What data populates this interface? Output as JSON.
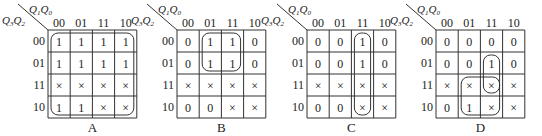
{
  "col_var": {
    "a": "Q",
    "a_sub": "1",
    "b": "Q",
    "b_sub": "0"
  },
  "row_var": {
    "a": "Q",
    "a_sub": "3",
    "b": "Q",
    "b_sub": "2"
  },
  "col_labels": [
    "00",
    "01",
    "11",
    "10"
  ],
  "row_labels": [
    "00",
    "01",
    "11",
    "10"
  ],
  "dont_care_symbol": "×",
  "maps": [
    {
      "caption": "A",
      "cells": [
        [
          "1",
          "1",
          "1",
          "1"
        ],
        [
          "1",
          "1",
          "1",
          "1"
        ],
        [
          "×",
          "×",
          "×",
          "×"
        ],
        [
          "1",
          "1",
          "×",
          "×"
        ]
      ],
      "groups": [
        {
          "rows": [
            0,
            3
          ],
          "cols": [
            0,
            3
          ]
        }
      ]
    },
    {
      "caption": "B",
      "cells": [
        [
          "0",
          "1",
          "1",
          "0"
        ],
        [
          "0",
          "1",
          "1",
          "0"
        ],
        [
          "×",
          "×",
          "×",
          "×"
        ],
        [
          "0",
          "0",
          "×",
          "×"
        ]
      ],
      "groups": [
        {
          "rows": [
            0,
            1
          ],
          "cols": [
            1,
            2
          ]
        }
      ]
    },
    {
      "caption": "C",
      "cells": [
        [
          "0",
          "0",
          "1",
          "0"
        ],
        [
          "0",
          "0",
          "1",
          "0"
        ],
        [
          "×",
          "×",
          "×",
          "×"
        ],
        [
          "0",
          "0",
          "×",
          "×"
        ]
      ],
      "groups": [
        {
          "rows": [
            0,
            3
          ],
          "cols": [
            2,
            2
          ]
        }
      ]
    },
    {
      "caption": "D",
      "cells": [
        [
          "0",
          "0",
          "0",
          "0"
        ],
        [
          "0",
          "0",
          "1",
          "0"
        ],
        [
          "×",
          "×",
          "×",
          "×"
        ],
        [
          "0",
          "1",
          "×",
          "×"
        ]
      ],
      "groups": [
        {
          "rows": [
            1,
            2
          ],
          "cols": [
            2,
            2
          ]
        },
        {
          "rows": [
            2,
            3
          ],
          "cols": [
            1,
            2
          ]
        }
      ]
    }
  ]
}
